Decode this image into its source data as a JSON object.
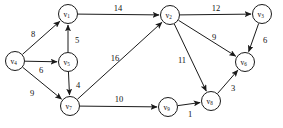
{
  "figure": {
    "background_color": "#ffffff",
    "stroke_color": "#1a1a1a",
    "width": 283,
    "height": 128
  },
  "chart_data": {
    "type": "diagram",
    "diagram_kind": "weighted-directed-graph",
    "title": "",
    "directed": true,
    "nodes": [
      {
        "id": "v1",
        "label": "v",
        "sub": "1",
        "x": 68,
        "y": 14,
        "r": 9.5
      },
      {
        "id": "v2",
        "label": "v",
        "sub": "2",
        "x": 170,
        "y": 15,
        "r": 9.5
      },
      {
        "id": "v3",
        "label": "v",
        "sub": "3",
        "x": 262,
        "y": 14,
        "r": 9.5
      },
      {
        "id": "v4",
        "label": "v",
        "sub": "4",
        "x": 15,
        "y": 61,
        "r": 9.5
      },
      {
        "id": "v5",
        "label": "v",
        "sub": "5",
        "x": 68,
        "y": 62,
        "r": 9.5
      },
      {
        "id": "v6",
        "label": "v",
        "sub": "6",
        "x": 245,
        "y": 62,
        "r": 9.5
      },
      {
        "id": "v7",
        "label": "v",
        "sub": "7",
        "x": 70,
        "y": 106,
        "r": 9.5
      },
      {
        "id": "v8",
        "label": "v",
        "sub": "8",
        "x": 211,
        "y": 101,
        "r": 9.5
      },
      {
        "id": "v9",
        "label": "v",
        "sub": "9",
        "x": 168,
        "y": 107,
        "r": 9.5
      }
    ],
    "edges": [
      {
        "id": "v4-v1",
        "from": "v4",
        "to": "v1",
        "weight": 8,
        "label_x": 33,
        "label_y": 34
      },
      {
        "id": "v5-v1",
        "from": "v5",
        "to": "v1",
        "weight": 5,
        "label_x": 77,
        "label_y": 40
      },
      {
        "id": "v1-v2",
        "from": "v1",
        "to": "v2",
        "weight": 14,
        "label_x": 118,
        "label_y": 8
      },
      {
        "id": "v4-v5",
        "from": "v4",
        "to": "v5",
        "weight": 6,
        "label_x": 41,
        "label_y": 70
      },
      {
        "id": "v4-v7",
        "from": "v4",
        "to": "v7",
        "weight": 9,
        "label_x": 32,
        "label_y": 93
      },
      {
        "id": "v5-v7",
        "from": "v5",
        "to": "v7",
        "weight": 4,
        "label_x": 78,
        "label_y": 85
      },
      {
        "id": "v7-v2",
        "from": "v7",
        "to": "v2",
        "weight": 16,
        "label_x": 115,
        "label_y": 58
      },
      {
        "id": "v2-v3",
        "from": "v2",
        "to": "v3",
        "weight": 12,
        "label_x": 216,
        "label_y": 8
      },
      {
        "id": "v2-v6",
        "from": "v2",
        "to": "v6",
        "weight": 9,
        "label_x": 214,
        "label_y": 37
      },
      {
        "id": "v2-v8",
        "from": "v2",
        "to": "v8",
        "weight": 11,
        "label_x": 182,
        "label_y": 60
      },
      {
        "id": "v3-v6",
        "from": "v3",
        "to": "v6",
        "weight": 6,
        "label_x": 265,
        "label_y": 40
      },
      {
        "id": "v7-v9",
        "from": "v7",
        "to": "v9",
        "weight": 10,
        "label_x": 119,
        "label_y": 99
      },
      {
        "id": "v9-v8",
        "from": "v9",
        "to": "v8",
        "weight": 1,
        "label_x": 190,
        "label_y": 114
      },
      {
        "id": "v8-v6",
        "from": "v8",
        "to": "v6",
        "weight": 3,
        "label_x": 233,
        "label_y": 88
      }
    ]
  }
}
